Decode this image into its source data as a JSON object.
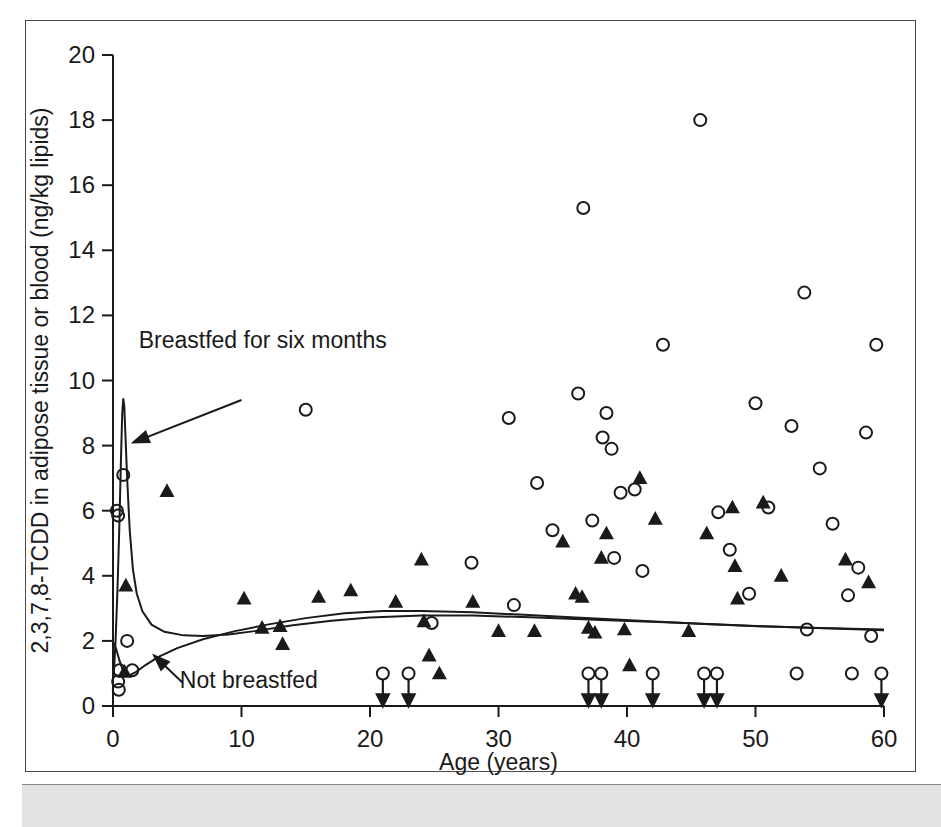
{
  "figure": {
    "kind": "scatter-plot-with-fitted-curves",
    "background_color": "#ffffff",
    "ink_color": "#1a1a1a",
    "page_band_color": "#e3e3e3"
  },
  "chart_data": {
    "type": "scatter",
    "title": "",
    "subtitle": "",
    "xlabel": "Age (years)",
    "ylabel": "2,3,7,8-TCDD in adipose tissue or blood (ng/kg lipids)",
    "xlim": [
      0,
      60
    ],
    "ylim": [
      0,
      20
    ],
    "xticks": [
      0,
      10,
      20,
      30,
      40,
      50,
      60
    ],
    "yticks": [
      0,
      2,
      4,
      6,
      8,
      10,
      12,
      14,
      16,
      18,
      20
    ],
    "grid": false,
    "legend_position": "none",
    "legend": [
      {
        "name": "Open circle marker",
        "marker": "open-circle"
      },
      {
        "name": "Filled triangle marker",
        "marker": "filled-triangle"
      }
    ],
    "annotations": [
      {
        "id": "breastfed-annotation",
        "text": "Breastfed for six months",
        "text_x": 2.0,
        "text_y": 11.0,
        "arrow_from_x": 10.0,
        "arrow_from_y": 9.4,
        "arrow_to_x": 1.6,
        "arrow_to_y": 8.1
      },
      {
        "id": "not-breastfed-annotation",
        "text": "Not breastfed",
        "text_x": 5.2,
        "text_y": 0.55,
        "arrow_from_x": 5.4,
        "arrow_from_y": 0.72,
        "arrow_to_x": 3.2,
        "arrow_to_y": 1.55
      }
    ],
    "series": [
      {
        "name": "Open circle measurements",
        "marker": "open-circle",
        "points": [
          [
            0.3,
            6.0
          ],
          [
            0.4,
            5.85
          ],
          [
            0.8,
            7.1
          ],
          [
            1.1,
            2.0
          ],
          [
            0.5,
            1.1
          ],
          [
            1.5,
            1.1
          ],
          [
            0.4,
            0.75
          ],
          [
            0.45,
            0.5
          ],
          [
            15.0,
            9.1
          ],
          [
            24.8,
            2.55
          ],
          [
            27.9,
            4.4
          ],
          [
            30.8,
            8.85
          ],
          [
            31.2,
            3.1
          ],
          [
            33.0,
            6.85
          ],
          [
            34.2,
            5.4
          ],
          [
            36.2,
            9.6
          ],
          [
            36.6,
            15.3
          ],
          [
            37.3,
            5.7
          ],
          [
            38.1,
            8.25
          ],
          [
            38.4,
            9.0
          ],
          [
            38.8,
            7.9
          ],
          [
            39.0,
            4.55
          ],
          [
            39.5,
            6.55
          ],
          [
            40.6,
            6.65
          ],
          [
            41.2,
            4.15
          ],
          [
            42.8,
            11.1
          ],
          [
            45.7,
            18.0
          ],
          [
            47.1,
            5.95
          ],
          [
            48.0,
            4.8
          ],
          [
            49.5,
            3.45
          ],
          [
            50.0,
            9.3
          ],
          [
            51.0,
            6.1
          ],
          [
            52.8,
            8.6
          ],
          [
            53.8,
            12.7
          ],
          [
            54.0,
            2.35
          ],
          [
            55.0,
            7.3
          ],
          [
            56.0,
            5.6
          ],
          [
            57.2,
            3.4
          ],
          [
            58.0,
            4.25
          ],
          [
            58.6,
            8.4
          ],
          [
            59.4,
            11.1
          ],
          [
            59.0,
            2.15
          ],
          [
            21.0,
            1.0
          ],
          [
            23.0,
            1.0
          ],
          [
            37.0,
            1.0
          ],
          [
            38.0,
            1.0
          ],
          [
            42.0,
            1.0
          ],
          [
            46.0,
            1.0
          ],
          [
            47.0,
            1.0
          ],
          [
            53.2,
            1.0
          ],
          [
            57.5,
            1.0
          ],
          [
            59.8,
            1.0
          ]
        ]
      },
      {
        "name": "Filled triangle measurements",
        "marker": "filled-triangle",
        "points": [
          [
            0.9,
            1.05
          ],
          [
            1.0,
            3.7
          ],
          [
            4.2,
            6.6
          ],
          [
            10.2,
            3.3
          ],
          [
            11.6,
            2.4
          ],
          [
            13.0,
            2.45
          ],
          [
            13.2,
            1.9
          ],
          [
            16.0,
            3.35
          ],
          [
            18.5,
            3.55
          ],
          [
            22.0,
            3.2
          ],
          [
            24.0,
            4.5
          ],
          [
            24.2,
            2.6
          ],
          [
            24.6,
            1.55
          ],
          [
            25.4,
            1.0
          ],
          [
            28.0,
            3.2
          ],
          [
            30.0,
            2.3
          ],
          [
            32.8,
            2.3
          ],
          [
            35.0,
            5.05
          ],
          [
            36.0,
            3.45
          ],
          [
            36.5,
            3.35
          ],
          [
            37.0,
            2.4
          ],
          [
            37.5,
            2.25
          ],
          [
            38.0,
            4.55
          ],
          [
            38.4,
            5.3
          ],
          [
            39.8,
            2.35
          ],
          [
            40.2,
            1.25
          ],
          [
            41.0,
            7.0
          ],
          [
            42.2,
            5.75
          ],
          [
            44.8,
            2.3
          ],
          [
            46.2,
            5.3
          ],
          [
            48.2,
            6.1
          ],
          [
            48.4,
            4.3
          ],
          [
            48.6,
            3.3
          ],
          [
            50.6,
            6.25
          ],
          [
            52.0,
            4.0
          ],
          [
            57.0,
            4.5
          ],
          [
            58.8,
            3.8
          ]
        ]
      }
    ],
    "censored_arrows": [
      {
        "x": 21.0,
        "from_y": 0.8,
        "to_y": 0.02
      },
      {
        "x": 23.0,
        "from_y": 0.8,
        "to_y": 0.02
      },
      {
        "x": 37.0,
        "from_y": 0.8,
        "to_y": 0.02
      },
      {
        "x": 38.0,
        "from_y": 0.8,
        "to_y": 0.02
      },
      {
        "x": 42.0,
        "from_y": 0.8,
        "to_y": 0.02
      },
      {
        "x": 46.0,
        "from_y": 0.8,
        "to_y": 0.02
      },
      {
        "x": 47.0,
        "from_y": 0.8,
        "to_y": 0.02
      },
      {
        "x": 59.8,
        "from_y": 0.8,
        "to_y": 0.02
      }
    ],
    "curves": [
      {
        "name": "Breastfed for six months",
        "points": [
          [
            0.05,
            0.9
          ],
          [
            0.2,
            2.0
          ],
          [
            0.35,
            3.6
          ],
          [
            0.5,
            5.6
          ],
          [
            0.62,
            7.6
          ],
          [
            0.72,
            9.0
          ],
          [
            0.8,
            9.45
          ],
          [
            0.88,
            9.2
          ],
          [
            0.97,
            8.3
          ],
          [
            1.1,
            7.0
          ],
          [
            1.3,
            5.4
          ],
          [
            1.55,
            4.2
          ],
          [
            1.85,
            3.45
          ],
          [
            2.3,
            2.9
          ],
          [
            3.0,
            2.5
          ],
          [
            4.0,
            2.28
          ],
          [
            5.5,
            2.17
          ],
          [
            7.0,
            2.15
          ],
          [
            9.0,
            2.2
          ],
          [
            11.0,
            2.3
          ],
          [
            14.0,
            2.48
          ],
          [
            17.0,
            2.62
          ],
          [
            20.0,
            2.72
          ],
          [
            24.0,
            2.78
          ],
          [
            28.0,
            2.78
          ],
          [
            33.0,
            2.72
          ],
          [
            38.0,
            2.64
          ],
          [
            44.0,
            2.56
          ],
          [
            50.0,
            2.46
          ],
          [
            55.0,
            2.4
          ],
          [
            60.0,
            2.35
          ]
        ]
      },
      {
        "name": "Not breastfed",
        "points": [
          [
            0.05,
            1.95
          ],
          [
            0.25,
            1.75
          ],
          [
            0.5,
            1.4
          ],
          [
            0.75,
            1.12
          ],
          [
            1.0,
            0.98
          ],
          [
            1.3,
            0.95
          ],
          [
            1.8,
            1.05
          ],
          [
            2.5,
            1.25
          ],
          [
            3.5,
            1.5
          ],
          [
            5.0,
            1.78
          ],
          [
            7.0,
            2.05
          ],
          [
            9.5,
            2.3
          ],
          [
            12.0,
            2.5
          ],
          [
            15.0,
            2.7
          ],
          [
            18.0,
            2.85
          ],
          [
            21.0,
            2.92
          ],
          [
            24.0,
            2.92
          ],
          [
            28.0,
            2.88
          ],
          [
            32.0,
            2.8
          ],
          [
            36.0,
            2.72
          ],
          [
            41.0,
            2.62
          ],
          [
            46.0,
            2.52
          ],
          [
            51.0,
            2.44
          ],
          [
            56.0,
            2.38
          ],
          [
            60.0,
            2.33
          ]
        ]
      }
    ]
  }
}
